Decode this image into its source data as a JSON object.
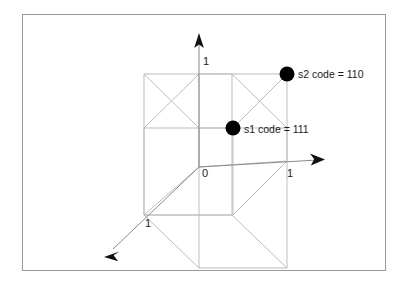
{
  "figure": {
    "background_color": "#ffffff",
    "frame_color": "#9a9a9a",
    "line_color": "#bdbdbd",
    "axis_color": "#8a8a8a",
    "point_color": "#000000",
    "text_color": "#1a1a1a"
  },
  "axes": [
    {
      "name": "vertical-axis",
      "tick_label": "1"
    },
    {
      "name": "horizontal-axis",
      "tick_label": "1"
    },
    {
      "name": "depth-axis",
      "tick_label": "1"
    }
  ],
  "tick_labels": {
    "y_one": "1",
    "origin": "0",
    "x_one": "1",
    "z_one": "1"
  },
  "points": [
    {
      "id": "s2",
      "label": "s2 code = 110",
      "code": "110"
    },
    {
      "id": "s1",
      "label": "s1 code = 111",
      "code": "111"
    }
  ]
}
